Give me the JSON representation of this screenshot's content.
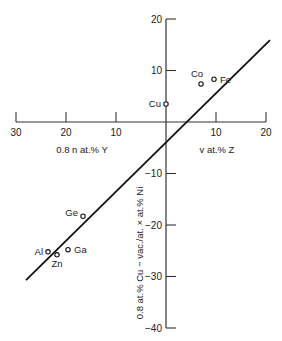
{
  "chart_data": {
    "type": "scatter",
    "title": "",
    "xlabel_left": "0.8 n at.% Y",
    "xlabel_right": "v at.% Z",
    "ylabel": "0.8 at.% Cu − vac./at. × at.% Ni",
    "x_ticks": [
      {
        "value": -30,
        "label": "30"
      },
      {
        "value": -20,
        "label": "20"
      },
      {
        "value": -10,
        "label": "10"
      },
      {
        "value": 10,
        "label": "10"
      },
      {
        "value": 20,
        "label": "20"
      }
    ],
    "y_ticks": [
      {
        "value": 20,
        "label": "20"
      },
      {
        "value": 10,
        "label": "10"
      },
      {
        "value": -10,
        "label": "−10"
      },
      {
        "value": -20,
        "label": "−20"
      },
      {
        "value": -30,
        "label": "−30"
      },
      {
        "value": -40,
        "label": "−40"
      }
    ],
    "xlim": [
      -30,
      20
    ],
    "ylim": [
      -40,
      20
    ],
    "grid": false,
    "points": [
      {
        "label": "Cu",
        "x": 0,
        "y": 3.5
      },
      {
        "label": "Co",
        "x": 7,
        "y": 7.4
      },
      {
        "label": "Fe",
        "x": 9.6,
        "y": 8.3
      },
      {
        "label": "Ge",
        "x": -16.6,
        "y": -18.3
      },
      {
        "label": "Al",
        "x": -23.6,
        "y": -25.2
      },
      {
        "label": "Zn",
        "x": -21.8,
        "y": -25.8
      },
      {
        "label": "Ga",
        "x": -19.6,
        "y": -24.8
      }
    ],
    "fit_line": {
      "x1": -28,
      "y1": -30.7,
      "x2": 20.8,
      "y2": 15.9
    }
  },
  "labels": {
    "xlabel_left": "0.8 n at.% Y",
    "xlabel_right": "v at.% Z",
    "ylabel": "0.8 at.% Cu − vac./at. × at.% Ni"
  }
}
